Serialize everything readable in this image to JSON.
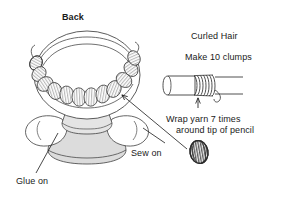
{
  "figure": {
    "background_color": "#ffffff",
    "ink_color": "#1a1a1a"
  },
  "labels": {
    "back": "Back",
    "curled_hair": "Curled Hair",
    "make_clumps": "Make 10 clumps",
    "wrap_line1": "Wrap yarn 7 times",
    "wrap_line2": "around tip of pencil",
    "sew_on": "Sew on",
    "glue_on": "Glue on"
  },
  "diagram": {
    "doll": {
      "description": "Back view of doll head with ring of yarn curl clumps around the head, body below",
      "curl_clump_count": 10,
      "head_fill": "#ffffff",
      "body_fill": "#e8e8e8",
      "arm_fill": "#ffffff",
      "skirt_fill": "#d9d9d9"
    },
    "pencil": {
      "description": "Pencil with yarn wrapped around its tip",
      "wrap_turns": 7,
      "body_fill": "#ffffff"
    },
    "clump_sample": {
      "description": "Single finished yarn clump removed from pencil",
      "fill": "#8a8a8a"
    }
  }
}
